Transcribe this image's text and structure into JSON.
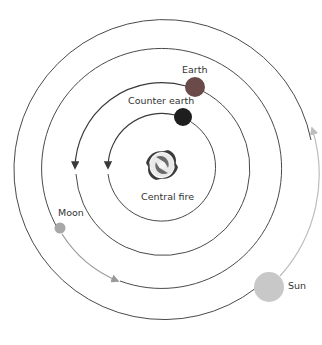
{
  "diagram": {
    "type": "concentric-orbits",
    "center": {
      "x": 162,
      "y": 168
    },
    "colors": {
      "orbit": "#4a4a4a",
      "earth": "#6b4a4a",
      "counter_earth": "#1e1e1e",
      "moon": "#a8a8a8",
      "sun": "#c8c8c8",
      "moon_arrow": "#9a9a9a",
      "sun_arrow": "#bdbdbd",
      "inner_arrow": "#3a3a3a"
    },
    "bodies": {
      "central_fire": {
        "label": "Central fire"
      },
      "counter_earth": {
        "label": "Counter earth"
      },
      "earth": {
        "label": "Earth"
      },
      "moon": {
        "label": "Moon"
      },
      "sun": {
        "label": "Sun"
      }
    }
  }
}
